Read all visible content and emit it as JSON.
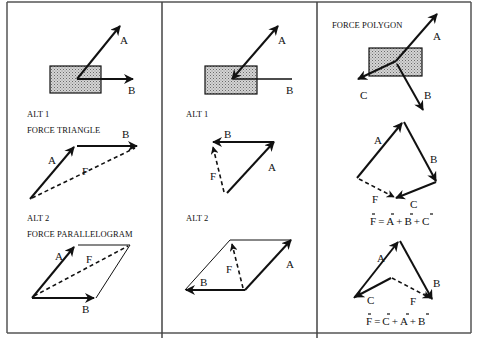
{
  "diagram": {
    "panels": [
      {
        "id": "left",
        "body": {
          "vectors": [
            "A",
            "B"
          ]
        },
        "alt1": {
          "label": "ALT 1",
          "title": "FORCE TRIANGLE",
          "vectors": [
            "A",
            "B",
            "F"
          ]
        },
        "alt2": {
          "label": "ALT 2",
          "title": "FORCE PARALLELOGRAM",
          "vectors": [
            "A",
            "F",
            "B"
          ]
        }
      },
      {
        "id": "middle",
        "body": {
          "vectors": [
            "A",
            "B"
          ]
        },
        "alt1": {
          "label": "ALT 1",
          "vectors": [
            "B",
            "F",
            "A"
          ]
        },
        "alt2": {
          "label": "ALT 2",
          "vectors": [
            "F",
            "A",
            "B"
          ]
        }
      },
      {
        "id": "right",
        "title": "FORCE POLYGON",
        "body": {
          "vectors": [
            "A",
            "C",
            "B"
          ]
        },
        "poly1": {
          "vectors": [
            "A",
            "B",
            "F",
            "C"
          ],
          "equation": "F = A + B + C"
        },
        "poly2": {
          "vectors": [
            "A",
            "B",
            "C",
            "F"
          ],
          "equation": "F = C + A + B"
        }
      }
    ]
  },
  "labels": {
    "A": "A",
    "B": "B",
    "C": "C",
    "F": "F",
    "alt1": "ALT 1",
    "alt2": "ALT 2",
    "force_triangle": "FORCE TRIANGLE",
    "force_parallelogram": "FORCE PARALLELOGRAM",
    "force_polygon": "FORCE POLYGON",
    "eq1": {
      "F": "F",
      "eq": "=",
      "A": "A",
      "plus1": "+",
      "B": "B",
      "plus2": "+",
      "C": "C"
    },
    "eq2": {
      "F": "F",
      "eq": "=",
      "C": "C",
      "plus1": "+",
      "A": "A",
      "plus2": "+",
      "B": "B"
    }
  },
  "colors": {
    "ink": "#111111",
    "frame": "#555555",
    "body_fill": "#b8b8b8"
  }
}
